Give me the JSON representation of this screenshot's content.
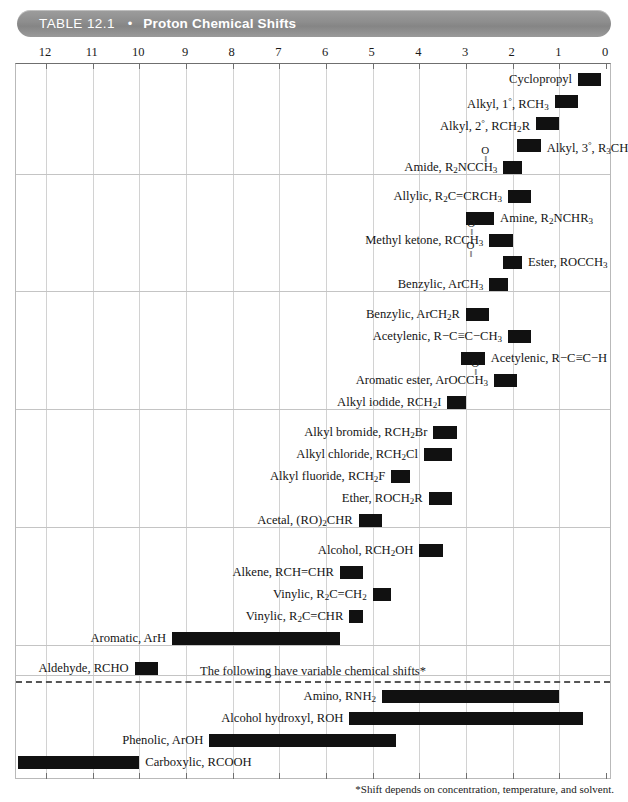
{
  "header": {
    "table_number": "TABLE 12.1",
    "separator": "•",
    "title": "Proton Chemical Shifts"
  },
  "axis": {
    "label": "ppm",
    "ticks": [
      12,
      11,
      10,
      9,
      8,
      7,
      6,
      5,
      4,
      3,
      2,
      1,
      0
    ],
    "min": 0,
    "max": 12.6,
    "direction": "reversed"
  },
  "variable_note": "The following have variable chemical shifts*",
  "footnote": "*Shift depends on concentration, temperature, and solvent.",
  "colors": {
    "bar": "#111111",
    "header_bar": "#8d8d8d",
    "grid": "#d2d2d2",
    "border": "#6f6f6f"
  },
  "chart_data": {
    "type": "bar",
    "orientation": "horizontal-range",
    "title": "Proton Chemical Shifts",
    "xlabel": "Chemical shift (ppm, δ)",
    "ylabel": "",
    "xlim": [
      12.6,
      0
    ],
    "grid": true,
    "legend": null,
    "categories": [
      "Cyclopropyl",
      "Alkyl, 1°, RCH3",
      "Alkyl, 2°, RCH2R",
      "Alkyl, 3°, R3CH",
      "Amide, R2NCCH3",
      "Allylic, R2C=CRCH3",
      "Amine, R2NCHR3",
      "Methyl ketone, RCCH3",
      "Ester, ROCCH3",
      "Benzylic, ArCH3",
      "Benzylic, ArCH2R",
      "Acetylenic, R-C≡C-CH3",
      "Acetylenic, R-C≡C-H",
      "Aromatic ester, ArOCCH3",
      "Alkyl iodide, RCH2I",
      "Alkyl bromide, RCH2Br",
      "Alkyl chloride, RCH2Cl",
      "Alkyl fluoride, RCH2F",
      "Ether, ROCH2R",
      "Acetal, (RO)2CHR",
      "Alcohol, RCH2OH",
      "Alkene, RCH=CHR",
      "Vinylic, R2C=CH2",
      "Vinylic, R2C=CHR",
      "Aromatic, ArH",
      "Aldehyde, RCHO",
      "Amino, RNH2",
      "Alcohol hydroxyl, ROH",
      "Phenolic, ArOH",
      "Carboxylic, RCOOH"
    ],
    "ranges": [
      [
        0.6,
        0.1
      ],
      [
        1.1,
        0.6
      ],
      [
        1.5,
        1.0
      ],
      [
        1.9,
        1.4
      ],
      [
        2.2,
        1.8
      ],
      [
        2.1,
        1.6
      ],
      [
        3.0,
        2.4
      ],
      [
        2.5,
        2.0
      ],
      [
        2.2,
        1.8
      ],
      [
        2.5,
        2.1
      ],
      [
        3.0,
        2.5
      ],
      [
        2.1,
        1.6
      ],
      [
        3.1,
        2.6
      ],
      [
        2.4,
        1.9
      ],
      [
        3.4,
        3.0
      ],
      [
        3.7,
        3.2
      ],
      [
        3.9,
        3.3
      ],
      [
        4.6,
        4.2
      ],
      [
        3.8,
        3.3
      ],
      [
        5.3,
        4.8
      ],
      [
        4.0,
        3.5
      ],
      [
        5.7,
        5.2
      ],
      [
        5.0,
        4.6
      ],
      [
        5.5,
        5.2
      ],
      [
        9.3,
        5.7
      ],
      [
        10.1,
        9.6
      ],
      [
        4.8,
        1.0
      ],
      [
        5.5,
        0.5
      ],
      [
        8.5,
        4.5
      ],
      [
        12.6,
        10.0
      ]
    ]
  },
  "sections": [
    {
      "id": "section-1",
      "rows": [
        {
          "label_html": "Cyclopropyl",
          "side": "left",
          "from": 0.6,
          "to": 0.1,
          "carbonyl": null
        },
        {
          "label_html": "Alkyl, 1<sup>°</sup>, RCH<sub>3</sub>",
          "side": "left",
          "from": 1.1,
          "to": 0.6,
          "carbonyl": null
        },
        {
          "label_html": "Alkyl, 2<sup>°</sup>, RCH<sub>2</sub>R",
          "side": "left",
          "from": 1.5,
          "to": 1.0,
          "carbonyl": null
        },
        {
          "label_html": "Alkyl, 3<sup>°</sup>, R<sub>3</sub>CH",
          "side": "right",
          "from": 1.9,
          "to": 1.4,
          "carbonyl": null
        },
        {
          "label_html": "Amide, R<sub>2</sub>NCCH<sub>3</sub>",
          "side": "left",
          "from": 2.2,
          "to": 1.8,
          "carbonyl": {
            "offset_chars": 3.1
          }
        }
      ]
    },
    {
      "id": "section-2",
      "rows": [
        {
          "label_html": "Allylic, R<sub>2</sub>C=CRCH<sub>3</sub>",
          "side": "left",
          "from": 2.1,
          "to": 1.6,
          "carbonyl": null
        },
        {
          "label_html": "Amine, R<sub>2</sub>NCHR<sub>3</sub>",
          "side": "right",
          "from": 3.0,
          "to": 2.4,
          "carbonyl": null
        },
        {
          "label_html": "Methyl ketone, RCCH<sub>3</sub>",
          "side": "left",
          "from": 2.5,
          "to": 2.0,
          "carbonyl": {
            "offset_chars": 3.1
          }
        },
        {
          "label_html": "Ester, ROCCH<sub>3</sub>",
          "side": "right",
          "from": 2.2,
          "to": 1.8,
          "carbonyl": {
            "offset_chars": 5.2
          }
        },
        {
          "label_html": "Benzylic, ArCH<sub>3</sub>",
          "side": "left",
          "from": 2.5,
          "to": 2.1,
          "carbonyl": null
        }
      ]
    },
    {
      "id": "section-3",
      "rows": [
        {
          "label_html": "Benzylic, ArCH<sub>2</sub>R",
          "side": "left",
          "from": 3.0,
          "to": 2.5,
          "carbonyl": null
        },
        {
          "label_html": "Acetylenic, R−C≡C−CH<sub>3</sub>",
          "side": "left",
          "from": 2.1,
          "to": 1.6,
          "carbonyl": null
        },
        {
          "label_html": "Acetylenic, R−C≡C−H",
          "side": "right",
          "from": 3.1,
          "to": 2.6,
          "carbonyl": null
        },
        {
          "label_html": "Aromatic ester, ArOCCH<sub>3</sub>",
          "side": "left",
          "from": 2.4,
          "to": 1.9,
          "carbonyl": {
            "offset_chars": 3.2
          }
        },
        {
          "label_html": "Alkyl iodide, RCH<sub>2</sub>I",
          "side": "left",
          "from": 3.4,
          "to": 3.0,
          "carbonyl": null
        }
      ]
    },
    {
      "id": "section-4",
      "rows": [
        {
          "label_html": "Alkyl bromide, RCH<sub>2</sub>Br",
          "side": "left",
          "from": 3.7,
          "to": 3.2,
          "carbonyl": null
        },
        {
          "label_html": "Alkyl chloride, RCH<sub>2</sub>Cl",
          "side": "left",
          "from": 3.9,
          "to": 3.3,
          "carbonyl": null
        },
        {
          "label_html": "Alkyl fluoride, RCH<sub>2</sub>F",
          "side": "left",
          "from": 4.6,
          "to": 4.2,
          "carbonyl": null
        },
        {
          "label_html": "Ether, ROCH<sub>2</sub>R",
          "side": "left",
          "from": 3.8,
          "to": 3.3,
          "carbonyl": null
        },
        {
          "label_html": "Acetal, (RO)<sub>2</sub>CHR",
          "side": "left",
          "from": 5.3,
          "to": 4.8,
          "carbonyl": null
        }
      ]
    },
    {
      "id": "section-5",
      "rows": [
        {
          "label_html": "Alcohol, RCH<sub>2</sub>OH",
          "side": "left",
          "from": 4.0,
          "to": 3.5,
          "carbonyl": null
        },
        {
          "label_html": "Alkene, RCH=CHR",
          "side": "left",
          "from": 5.7,
          "to": 5.2,
          "carbonyl": null
        },
        {
          "label_html": "Vinylic, R<sub>2</sub>C=CH<sub>2</sub>",
          "side": "left",
          "from": 5.0,
          "to": 4.6,
          "carbonyl": null
        },
        {
          "label_html": "Vinylic, R<sub>2</sub>C=CHR",
          "side": "left",
          "from": 5.5,
          "to": 5.2,
          "carbonyl": null
        },
        {
          "label_html": "Aromatic, ArH",
          "side": "left",
          "from": 9.3,
          "to": 5.7,
          "carbonyl": null
        }
      ]
    },
    {
      "id": "section-6",
      "rows": [
        {
          "label_html": "Aldehyde, RCHO",
          "side": "left",
          "from": 10.1,
          "to": 9.6,
          "carbonyl": null
        }
      ]
    },
    {
      "id": "section-variable",
      "rows": [
        {
          "label_html": "Amino, RNH<sub>2</sub>",
          "side": "left",
          "from": 4.8,
          "to": 1.0,
          "carbonyl": null
        },
        {
          "label_html": "Alcohol hydroxyl, ROH",
          "side": "left",
          "from": 5.5,
          "to": 0.5,
          "carbonyl": null
        },
        {
          "label_html": "Phenolic, ArOH",
          "side": "left",
          "from": 8.5,
          "to": 4.5,
          "carbonyl": null
        },
        {
          "label_html": "Carboxylic, RCOOH",
          "side": "right",
          "from": 12.6,
          "to": 10.0,
          "carbonyl": null
        }
      ]
    }
  ]
}
